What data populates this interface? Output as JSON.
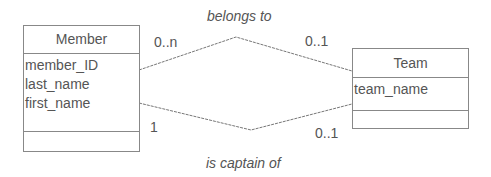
{
  "classes": {
    "member": {
      "name": "Member",
      "attributes": [
        "member_ID",
        "last_name",
        "first_name"
      ]
    },
    "team": {
      "name": "Team",
      "attributes": [
        "team_name"
      ]
    }
  },
  "associations": {
    "belongs_to": {
      "label": "belongs to",
      "member_multiplicity": "0..n",
      "team_multiplicity": "0..1"
    },
    "is_captain_of": {
      "label": "is captain of",
      "member_multiplicity": "1",
      "team_multiplicity": "0..1"
    }
  },
  "colors": {
    "line": "#777777",
    "text": "#555555"
  }
}
